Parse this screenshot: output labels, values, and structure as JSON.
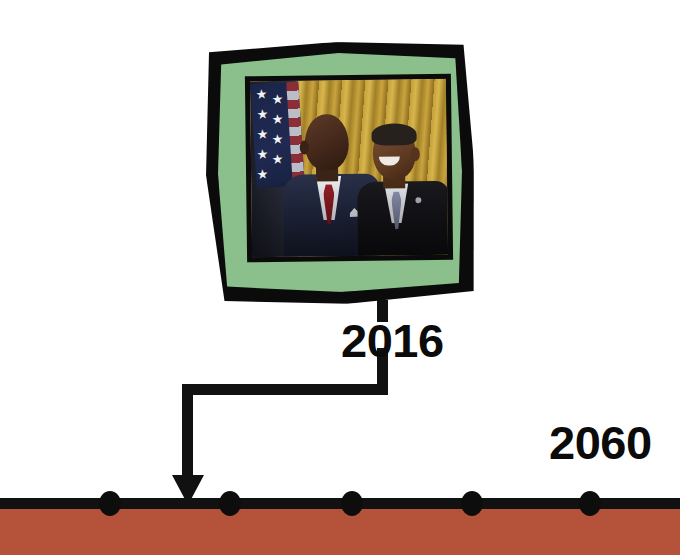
{
  "canvas": {
    "width": 680,
    "height": 555,
    "background": "#ffffff"
  },
  "colors": {
    "timeline_band": "#b5533a",
    "timeline_axis": "#111111",
    "frame_outline": "#0b0b0b",
    "frame_mat": "#8bbf8b",
    "label_text": "#0b0b0b"
  },
  "timeline": {
    "name": "history-timeline",
    "axis_label": "",
    "ticks": [
      {
        "id": "tick-1",
        "x": 110,
        "year": ""
      },
      {
        "id": "tick-2",
        "x": 230,
        "year": ""
      },
      {
        "id": "tick-3",
        "x": 352,
        "year": ""
      },
      {
        "id": "tick-4",
        "x": 472,
        "year": ""
      },
      {
        "id": "tick-5",
        "x": 590,
        "year": ""
      }
    ],
    "labels": [
      {
        "id": "year-2016",
        "text": "2016",
        "x": 341,
        "y": 317,
        "connected": true
      },
      {
        "id": "year-2060",
        "text": "2060",
        "x": 549,
        "y": 419,
        "connected": false
      }
    ]
  },
  "connector": {
    "name": "elbow-connector",
    "from_label": "2016",
    "to_tick_x": 187,
    "arrow_direction": "down"
  },
  "photo_card": {
    "name": "framed-photo-2016",
    "caption": "2016",
    "frame_style": "hand-drawn-black-outline",
    "mat_color": "#8bbf8b",
    "scene": {
      "alt": "Michael Jordan and Barack Obama standing together in the White House",
      "background": "gold-curtains",
      "figures": [
        {
          "id": "figure-michael-jordan",
          "name": "Michael Jordan",
          "suit": "navy plaid",
          "tie": "red",
          "accessory": "white pocket square"
        },
        {
          "id": "figure-barack-obama",
          "name": "Barack Obama",
          "suit": "black",
          "tie": "lavender gray",
          "accessory": "flag lapel pin"
        }
      ],
      "props": [
        {
          "id": "american-flag",
          "name": "American flag"
        },
        {
          "id": "gold-curtain",
          "name": "Gold curtain backdrop"
        }
      ]
    }
  }
}
